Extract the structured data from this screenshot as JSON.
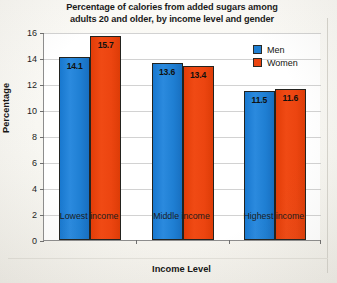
{
  "chart_data": {
    "type": "bar",
    "title": "Percentage of calories from added sugars among adults 20 and older, by income level and gender",
    "title_lines": [
      "Percentage of calories from added sugars among",
      "adults 20 and older, by income level and gender"
    ],
    "xlabel": "Income Level",
    "ylabel": "Percentage",
    "categories": [
      "Lowest income",
      "Middle income",
      "Highest income"
    ],
    "series": [
      {
        "name": "Men",
        "color": "#1f7fd3",
        "values": [
          14.1,
          13.6,
          11.5
        ]
      },
      {
        "name": "Women",
        "color": "#ec4510",
        "values": [
          15.7,
          13.4,
          11.6
        ]
      }
    ],
    "ylim": [
      0,
      16
    ],
    "yticks": [
      0,
      2,
      4,
      6,
      8,
      10,
      12,
      14,
      16
    ],
    "ytick_labels": [
      "0",
      "2",
      "4",
      "6",
      "8",
      "10",
      "12",
      "14",
      "16"
    ],
    "grid": true,
    "grid_axis": "y",
    "legend_position": "top-right",
    "data_labels": true,
    "value_labels": {
      "men": [
        "14.1",
        "13.6",
        "11.5"
      ],
      "women": [
        "15.7",
        "13.4",
        "11.6"
      ]
    }
  },
  "legend": {
    "items": [
      {
        "label": "Men",
        "color": "#1f7fd3"
      },
      {
        "label": "Women",
        "color": "#ec4510"
      }
    ]
  }
}
